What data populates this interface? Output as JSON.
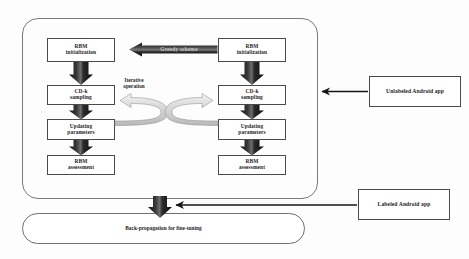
{
  "diagram": {
    "colors": {
      "box_border": "#4a4a4a",
      "container_border": "#7a7a7a",
      "block_arrow_dark": "#1a1a1a",
      "block_arrow_gray": "#d3d3d3",
      "line_arrow": "#1a1a1a",
      "text": "#1d1d1d",
      "arrow_label_text": "#c9c9c9",
      "background": "#ffffff"
    },
    "outer_container": {
      "name": "pretraining-container"
    },
    "left_column": {
      "name": "left-rbm-stack",
      "nodes": [
        {
          "id": "left-rbm-initialization",
          "label": "RBM\ninitialization"
        },
        {
          "id": "left-cdk-sampling",
          "label": "CD-k\nsampling"
        },
        {
          "id": "left-updating-parameters",
          "label": "Updating\nparameters"
        },
        {
          "id": "left-rbm-assessment",
          "label": "RBM\nassessment"
        }
      ]
    },
    "right_column": {
      "name": "right-rbm-stack",
      "nodes": [
        {
          "id": "right-rbm-initialization",
          "label": "RBM\ninitialization"
        },
        {
          "id": "right-cdk-sampling",
          "label": "CD-k\nsampling"
        },
        {
          "id": "right-updating-parameters",
          "label": "Updating\nparameters"
        },
        {
          "id": "right-rbm-assessment",
          "label": "RBM\nassessment"
        }
      ]
    },
    "labels": {
      "greedy_scheme": "Greedy scheme",
      "iterative_operation": "Iterative\noperation"
    },
    "inputs": [
      {
        "id": "unlabeled-android-app",
        "label": "Unlabeled Android app"
      },
      {
        "id": "labeled-android-app",
        "label": "Labeled Android app"
      }
    ],
    "output": {
      "id": "back-propagation-stage",
      "label": "Back-propagation for\nfine-tuning"
    }
  }
}
